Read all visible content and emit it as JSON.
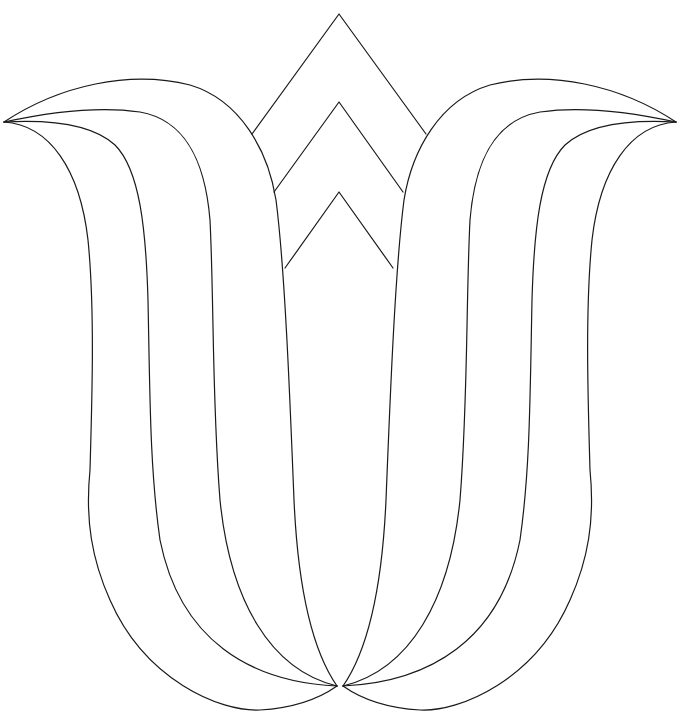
{
  "figure": {
    "subject": "Tulip outline coloring page",
    "line_color": "#1a1a1a",
    "background": "#ffffff"
  }
}
